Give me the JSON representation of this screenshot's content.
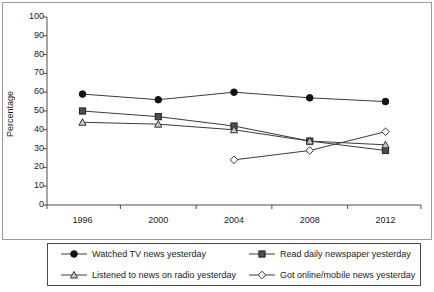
{
  "chart_data": {
    "type": "line",
    "title": "",
    "xlabel": "",
    "ylabel": "Percentage",
    "categories": [
      "1996",
      "2000",
      "2004",
      "2008",
      "2012"
    ],
    "x": [
      1996,
      2000,
      2004,
      2008,
      2012
    ],
    "ylim": [
      0,
      100
    ],
    "yticks": [
      0,
      10,
      20,
      30,
      40,
      50,
      60,
      70,
      80,
      90,
      100
    ],
    "ytick_labels": [
      "0",
      "10",
      "20",
      "30",
      "40",
      "50",
      "60",
      "70",
      "80",
      "90",
      "100"
    ],
    "grid": false,
    "legend_position": "bottom",
    "series": [
      {
        "name": "Watched TV news yesterday",
        "marker": "filled-circle",
        "color": "#111111",
        "values": [
          59,
          56,
          60,
          57,
          55
        ]
      },
      {
        "name": "Read daily newspaper yesterday",
        "marker": "filled-square",
        "color": "#3f3f3f",
        "values": [
          50,
          47,
          42,
          34,
          29
        ]
      },
      {
        "name": "Listened to news on radio yesterday",
        "marker": "open-triangle",
        "color": "#4a4a4a",
        "values": [
          44,
          43,
          40,
          34,
          32
        ]
      },
      {
        "name": "Got online/mobile news yesterday",
        "marker": "open-diamond",
        "color": "#4a4a4a",
        "values": [
          null,
          null,
          24,
          29,
          39
        ]
      }
    ]
  },
  "legend": {
    "items": [
      {
        "label": "Watched TV news yesterday",
        "marker": "filled-circle-marker"
      },
      {
        "label": "Read daily newspaper yesterday",
        "marker": "filled-square-marker"
      },
      {
        "label": "Listened to news on radio yesterday",
        "marker": "open-triangle-marker"
      },
      {
        "label": "Got online/mobile news yesterday",
        "marker": "open-diamond-marker"
      }
    ]
  },
  "axes": {
    "y_label": "Percentage"
  },
  "colors": {
    "axis": "#4a4a4a",
    "line": "#3a3a3a",
    "frame": "#9a9a9a",
    "text": "#1a1a1a"
  }
}
